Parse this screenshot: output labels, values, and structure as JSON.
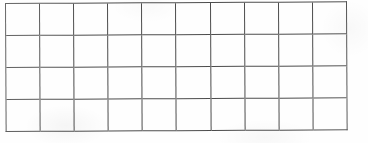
{
  "document": {
    "kind": "blank-grid",
    "description": "Blank empty grid of rectangular cells",
    "content_text": ""
  },
  "grid": {
    "columns": 10,
    "rows": 4,
    "cell_text": [
      [
        "",
        "",
        "",
        "",
        "",
        "",
        "",
        "",
        "",
        ""
      ],
      [
        "",
        "",
        "",
        "",
        "",
        "",
        "",
        "",
        "",
        ""
      ],
      [
        "",
        "",
        "",
        "",
        "",
        "",
        "",
        "",
        "",
        ""
      ],
      [
        "",
        "",
        "",
        "",
        "",
        "",
        "",
        "",
        "",
        ""
      ]
    ],
    "geometry": {
      "left_px": 5,
      "top_px": 3,
      "width_px": 342,
      "height_px": 129,
      "cell_width_px": 34.2,
      "cell_height_px": 32.25,
      "vertical_line_count": 11,
      "horizontal_line_count": 5,
      "line_width_px": 1.6,
      "skew_degrees": -0.28
    },
    "colors": {
      "line": "#4c4c4c",
      "cell_fill": "#ffffff",
      "page_background": "#fefefe"
    }
  }
}
